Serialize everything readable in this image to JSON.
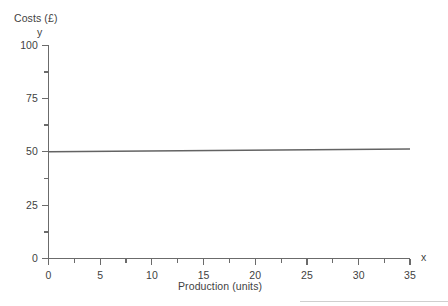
{
  "chart_data": {
    "type": "line",
    "title": "",
    "subtitle": "",
    "xlabel": "Production (units)",
    "ylabel": "Costs (£)",
    "x_axis_name": "x",
    "y_axis_name": "y",
    "xlim": [
      0,
      35
    ],
    "ylim": [
      0,
      100
    ],
    "x_ticks": [
      0,
      5,
      10,
      15,
      20,
      25,
      30,
      35
    ],
    "x_tick_labels": [
      "0",
      "5",
      "10",
      "15",
      "20",
      "25",
      "30",
      "35"
    ],
    "x_minor_ticks": [
      2.5,
      7.5,
      12.5,
      17.5,
      22.5,
      27.5,
      32.5
    ],
    "y_ticks": [
      0,
      25,
      50,
      75,
      100
    ],
    "y_tick_labels": [
      "0",
      "25",
      "50",
      "75",
      "100"
    ],
    "y_minor_ticks": [
      12.5,
      37.5,
      62.5,
      87.5
    ],
    "grid": false,
    "legend": false,
    "legend_position": "none",
    "line_color": "#636363",
    "axis_color": "#6b6b6b",
    "background_color": "#ffffff",
    "series": [
      {
        "name": "Fixed costs",
        "x": [
          0,
          5,
          10,
          15,
          20,
          25,
          30,
          35
        ],
        "values": [
          50,
          50,
          50,
          50,
          50,
          50,
          50,
          50
        ]
      }
    ],
    "annotations": []
  },
  "labels": {
    "y_axis_title": "Costs (£)",
    "y_axis_name": "y",
    "x_axis_title": "Production (units)",
    "x_axis_name": "x"
  },
  "y_tick_text": {
    "t0": "0",
    "t25": "25",
    "t50": "50",
    "t75": "75",
    "t100": "100"
  },
  "x_tick_text": {
    "t0": "0",
    "t5": "5",
    "t10": "10",
    "t15": "15",
    "t20": "20",
    "t25": "25",
    "t30": "30",
    "t35": "35"
  }
}
